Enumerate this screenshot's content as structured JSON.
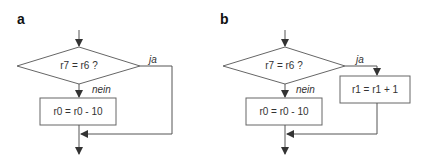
{
  "panels": [
    {
      "label": "a",
      "decision": "r7 = r6 ?",
      "yes_label": "ja",
      "no_label": "nein",
      "no_action": "r0 = r0 - 10"
    },
    {
      "label": "b",
      "decision": "r7 = r6 ?",
      "yes_label": "ja",
      "no_label": "nein",
      "no_action": "r0 = r0 - 10",
      "yes_action": "r1 = r1 + 1"
    }
  ],
  "colors": {
    "line": "#555555",
    "text": "#333333"
  }
}
